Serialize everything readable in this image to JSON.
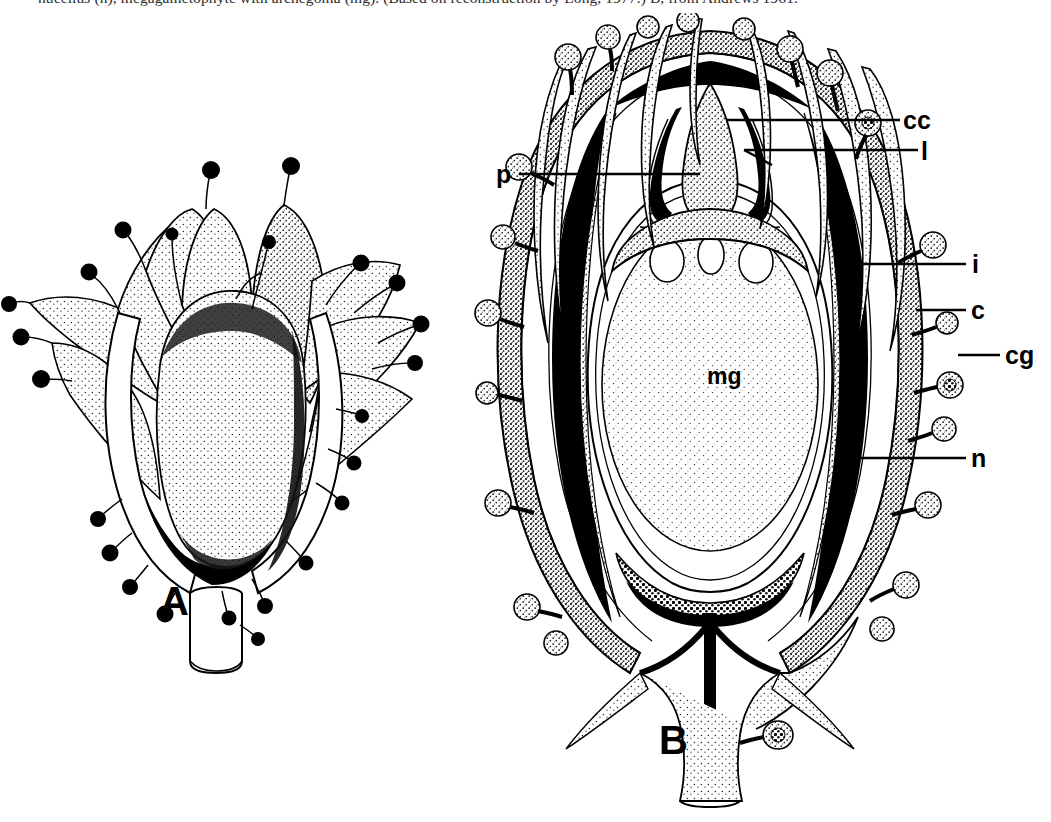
{
  "caption": {
    "line_1": "nucellus (n), megagametophyte with archegonia (mg). (Based on reconstruction by Long, 1977.) B, from Andrews 1961."
  },
  "figure": {
    "panels": [
      {
        "id": "A",
        "label": "A",
        "description": "Whole cupule with spreading glandular bracts enclosing a single ovule, borne on a short stalk"
      },
      {
        "id": "B",
        "label": "B",
        "description": "Longitudinal section of cupule and ovule showing internal tissue layers"
      }
    ]
  },
  "labels": [
    {
      "key": "cc",
      "text": "cc",
      "meaning": "pollen chamber / central column"
    },
    {
      "key": "l",
      "text": "l",
      "meaning": "lagenostome lip"
    },
    {
      "key": "p",
      "text": "p",
      "meaning": "pollen chamber"
    },
    {
      "key": "i",
      "text": "i",
      "meaning": "integument"
    },
    {
      "key": "c",
      "text": "c",
      "meaning": "cupule"
    },
    {
      "key": "cg",
      "text": "cg",
      "meaning": "cupule gland"
    },
    {
      "key": "n",
      "text": "n",
      "meaning": "nucellus"
    },
    {
      "key": "mg",
      "text": "mg",
      "meaning": "megagametophyte with archegonia"
    }
  ],
  "colors": {
    "ink": "#000000",
    "paper": "#ffffff",
    "stipple": "#2c2c2c",
    "caption_ink": "#2b2b2b"
  }
}
